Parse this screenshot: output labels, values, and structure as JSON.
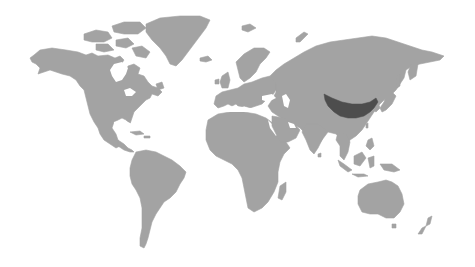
{
  "map": {
    "type": "choropleth-world",
    "projection": "equirectangular-like",
    "base_color": "#a3a3a3",
    "background_color": "#ffffff",
    "highlight_color": "#4d4d4d",
    "highlighted_regions": [
      {
        "name": "Northern China",
        "color": "#4d4d4d"
      }
    ],
    "regions": [
      "North America",
      "Greenland",
      "Canadian Arctic Archipelago",
      "Central America & Caribbean",
      "South America",
      "Europe",
      "Iceland",
      "British Isles",
      "Scandinavia",
      "Africa",
      "Madagascar",
      "Arabian Peninsula",
      "Asia",
      "India",
      "Southeast Asia",
      "Japan",
      "Indonesia",
      "Philippines",
      "New Guinea",
      "Australia",
      "Tasmania",
      "New Zealand",
      "Svalbard",
      "Novaya Zemlya"
    ]
  }
}
